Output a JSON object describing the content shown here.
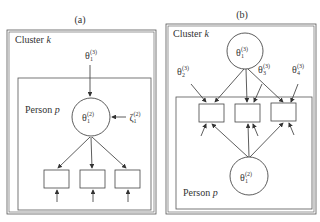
{
  "panel_a": {
    "label": "(a)",
    "cluster_label": "Cluster",
    "cluster_var": "k",
    "person_label": "Person",
    "person_var": "p",
    "top_var": {
      "sym": "θ",
      "sub": "1",
      "sup": "(3)"
    },
    "circle_var": {
      "sym": "θ",
      "sub": "1",
      "sup": "(2)"
    },
    "error_var": {
      "sym": "ζ",
      "sub": "1",
      "sup": "(2)"
    },
    "item_count": 3
  },
  "panel_b": {
    "label": "(b)",
    "cluster_label": "Cluster",
    "cluster_var": "k",
    "person_label": "Person",
    "person_var": "p",
    "top_circle_var": {
      "sym": "θ",
      "sub": "1",
      "sup": "(3)"
    },
    "item_vars": [
      {
        "sym": "θ",
        "sub": "2",
        "sup": "(3)"
      },
      {
        "sym": "θ",
        "sub": "3",
        "sup": "(3)"
      },
      {
        "sym": "θ",
        "sub": "4",
        "sup": "(3)"
      }
    ],
    "bottom_circle_var": {
      "sym": "θ",
      "sub": "1",
      "sup": "(2)"
    },
    "item_count": 3
  }
}
